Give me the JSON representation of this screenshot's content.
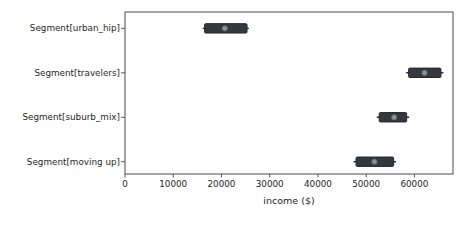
{
  "figure": {
    "background": "#ffffff"
  },
  "chart_data": {
    "type": "boxplot",
    "orientation": "horizontal",
    "title": "",
    "xlabel": "income ($)",
    "ylabel": "",
    "xlim": [
      0,
      68000
    ],
    "x_ticks": [
      0,
      10000,
      20000,
      30000,
      40000,
      50000,
      60000
    ],
    "x_tick_labels": [
      "0",
      "10000",
      "20000",
      "30000",
      "40000",
      "50000",
      "60000"
    ],
    "categories": [
      "Segment[urban_hip]",
      "Segment[travelers]",
      "Segment[suburb_mix]",
      "Segment[moving up]"
    ],
    "boxes": [
      {
        "label": "Segment[urban_hip]",
        "whisker_low": 16100,
        "q1": 16500,
        "median": 20700,
        "q3": 25300,
        "whisker_high": 25700
      },
      {
        "label": "Segment[travelers]",
        "whisker_low": 58300,
        "q1": 58800,
        "median": 62100,
        "q3": 65500,
        "whisker_high": 66000
      },
      {
        "label": "Segment[suburb_mix]",
        "whisker_low": 52200,
        "q1": 52700,
        "median": 55800,
        "q3": 58400,
        "whisker_high": 58900
      },
      {
        "label": "Segment[moving up]",
        "whisker_low": 47400,
        "q1": 47900,
        "median": 51700,
        "q3": 55700,
        "whisker_high": 56200
      }
    ],
    "grid": false,
    "legend": null,
    "colors": {
      "box_fill": "#35383c",
      "box_edge": "#26282c",
      "whisker": "#2b2d30",
      "median_dot_fill": "#8f9296",
      "median_dot_edge": "#6a6d71",
      "spine": "#4a4a4a",
      "tick": "#4a4a4a",
      "text": "#262626"
    }
  }
}
